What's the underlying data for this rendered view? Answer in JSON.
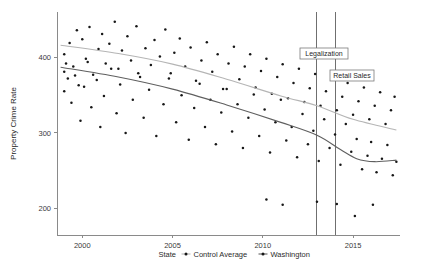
{
  "chart_data": {
    "type": "scatter",
    "title": "",
    "subtitle": "",
    "xlabel": "",
    "ylabel": "Property Crime Rate",
    "xlim": [
      1998.6,
      2017.6
    ],
    "ylim": [
      165,
      460
    ],
    "xticks": [
      2000,
      2005,
      2010,
      2015
    ],
    "xticklabels": [
      "2000",
      "2005",
      "2010",
      "2015"
    ],
    "yticks": [
      200,
      300,
      400
    ],
    "yticklabels": [
      "200",
      "300",
      "400"
    ],
    "grid": false,
    "legend_position": "bottom",
    "legend_title": "State",
    "annotations": [
      {
        "label": "Legalization",
        "x": 2013
      },
      {
        "label": "Retail Sales",
        "x": 2014
      }
    ],
    "vlines": [
      2013,
      2014
    ],
    "series": [
      {
        "name": "Control Average",
        "color": "#b5b5b5",
        "marker": "point",
        "trend": [
          {
            "x": 1998.8,
            "y": 416
          },
          {
            "x": 2002.0,
            "y": 405
          },
          {
            "x": 2005.0,
            "y": 391
          },
          {
            "x": 2008.0,
            "y": 371
          },
          {
            "x": 2011.0,
            "y": 349
          },
          {
            "x": 2013.0,
            "y": 336
          },
          {
            "x": 2015.0,
            "y": 318
          },
          {
            "x": 2017.4,
            "y": 304
          }
        ],
        "points": [
          {
            "x": 1999.0,
            "y": 404
          },
          {
            "x": 1999.0,
            "y": 381
          },
          {
            "x": 1999.2,
            "y": 372
          },
          {
            "x": 1999.3,
            "y": 419
          },
          {
            "x": 1999.5,
            "y": 388
          },
          {
            "x": 1999.7,
            "y": 436
          },
          {
            "x": 1999.8,
            "y": 363
          },
          {
            "x": 2000.0,
            "y": 424
          },
          {
            "x": 2000.2,
            "y": 398
          },
          {
            "x": 2000.4,
            "y": 440
          },
          {
            "x": 2000.6,
            "y": 377
          },
          {
            "x": 2000.9,
            "y": 411
          },
          {
            "x": 2001.1,
            "y": 431
          },
          {
            "x": 2001.3,
            "y": 392
          },
          {
            "x": 2001.5,
            "y": 418
          },
          {
            "x": 2001.8,
            "y": 447
          },
          {
            "x": 2002.0,
            "y": 385
          },
          {
            "x": 2002.2,
            "y": 409
          },
          {
            "x": 2002.5,
            "y": 428
          },
          {
            "x": 2002.7,
            "y": 396
          },
          {
            "x": 2003.0,
            "y": 441
          },
          {
            "x": 2003.2,
            "y": 374
          },
          {
            "x": 2003.5,
            "y": 412
          },
          {
            "x": 2003.8,
            "y": 390
          },
          {
            "x": 2004.0,
            "y": 423
          },
          {
            "x": 2004.3,
            "y": 401
          },
          {
            "x": 2004.6,
            "y": 437
          },
          {
            "x": 2004.9,
            "y": 379
          },
          {
            "x": 2005.1,
            "y": 406
          },
          {
            "x": 2005.4,
            "y": 425
          },
          {
            "x": 2005.7,
            "y": 388
          },
          {
            "x": 2006.0,
            "y": 413
          },
          {
            "x": 2006.3,
            "y": 369
          },
          {
            "x": 2006.6,
            "y": 396
          },
          {
            "x": 2006.9,
            "y": 420
          },
          {
            "x": 2007.2,
            "y": 381
          },
          {
            "x": 2007.5,
            "y": 404
          },
          {
            "x": 2007.8,
            "y": 358
          },
          {
            "x": 2008.1,
            "y": 392
          },
          {
            "x": 2008.4,
            "y": 414
          },
          {
            "x": 2008.7,
            "y": 371
          },
          {
            "x": 2009.0,
            "y": 388
          },
          {
            "x": 2009.3,
            "y": 404
          },
          {
            "x": 2009.6,
            "y": 360
          },
          {
            "x": 2009.9,
            "y": 382
          },
          {
            "x": 2010.2,
            "y": 398
          },
          {
            "x": 2010.5,
            "y": 352
          },
          {
            "x": 2010.8,
            "y": 374
          },
          {
            "x": 2011.1,
            "y": 391
          },
          {
            "x": 2011.4,
            "y": 346
          },
          {
            "x": 2011.7,
            "y": 366
          },
          {
            "x": 2012.0,
            "y": 385
          },
          {
            "x": 2012.3,
            "y": 341
          },
          {
            "x": 2012.6,
            "y": 359
          },
          {
            "x": 2012.9,
            "y": 378
          },
          {
            "x": 2013.2,
            "y": 336
          },
          {
            "x": 2013.5,
            "y": 355
          },
          {
            "x": 2013.8,
            "y": 372
          },
          {
            "x": 2014.1,
            "y": 330
          },
          {
            "x": 2014.4,
            "y": 348
          },
          {
            "x": 2014.7,
            "y": 366
          },
          {
            "x": 2015.0,
            "y": 324
          },
          {
            "x": 2015.3,
            "y": 342
          },
          {
            "x": 2015.6,
            "y": 360
          },
          {
            "x": 2015.9,
            "y": 318
          },
          {
            "x": 2016.2,
            "y": 336
          },
          {
            "x": 2016.5,
            "y": 354
          },
          {
            "x": 2016.8,
            "y": 312
          },
          {
            "x": 2017.1,
            "y": 330
          },
          {
            "x": 2017.3,
            "y": 348
          }
        ]
      },
      {
        "name": "Washington",
        "color": "#5f5f5f",
        "marker": "point",
        "trend": [
          {
            "x": 1998.8,
            "y": 387
          },
          {
            "x": 2002.0,
            "y": 374
          },
          {
            "x": 2005.0,
            "y": 358
          },
          {
            "x": 2008.0,
            "y": 337
          },
          {
            "x": 2011.0,
            "y": 314
          },
          {
            "x": 2013.0,
            "y": 297
          },
          {
            "x": 2014.3,
            "y": 278
          },
          {
            "x": 2015.2,
            "y": 266
          },
          {
            "x": 2016.2,
            "y": 262
          },
          {
            "x": 2017.4,
            "y": 264
          }
        ],
        "points": [
          {
            "x": 1999.0,
            "y": 355
          },
          {
            "x": 1999.1,
            "y": 392
          },
          {
            "x": 1999.4,
            "y": 340
          },
          {
            "x": 1999.6,
            "y": 376
          },
          {
            "x": 1999.9,
            "y": 316
          },
          {
            "x": 2000.1,
            "y": 361
          },
          {
            "x": 2000.3,
            "y": 394
          },
          {
            "x": 2000.5,
            "y": 334
          },
          {
            "x": 2000.8,
            "y": 370
          },
          {
            "x": 2001.0,
            "y": 308
          },
          {
            "x": 2001.2,
            "y": 349
          },
          {
            "x": 2001.6,
            "y": 385
          },
          {
            "x": 2001.9,
            "y": 326
          },
          {
            "x": 2002.1,
            "y": 364
          },
          {
            "x": 2002.4,
            "y": 300
          },
          {
            "x": 2002.8,
            "y": 344
          },
          {
            "x": 2003.1,
            "y": 379
          },
          {
            "x": 2003.4,
            "y": 320
          },
          {
            "x": 2003.7,
            "y": 357
          },
          {
            "x": 2004.1,
            "y": 296
          },
          {
            "x": 2004.5,
            "y": 338
          },
          {
            "x": 2004.8,
            "y": 372
          },
          {
            "x": 2005.2,
            "y": 314
          },
          {
            "x": 2005.5,
            "y": 350
          },
          {
            "x": 2005.9,
            "y": 291
          },
          {
            "x": 2006.2,
            "y": 333
          },
          {
            "x": 2006.5,
            "y": 365
          },
          {
            "x": 2006.8,
            "y": 308
          },
          {
            "x": 2007.1,
            "y": 344
          },
          {
            "x": 2007.4,
            "y": 285
          },
          {
            "x": 2007.7,
            "y": 327
          },
          {
            "x": 2008.0,
            "y": 358
          },
          {
            "x": 2008.3,
            "y": 302
          },
          {
            "x": 2008.6,
            "y": 338
          },
          {
            "x": 2008.9,
            "y": 280
          },
          {
            "x": 2009.2,
            "y": 320
          },
          {
            "x": 2009.5,
            "y": 351
          },
          {
            "x": 2009.8,
            "y": 296
          },
          {
            "x": 2010.1,
            "y": 331
          },
          {
            "x": 2010.2,
            "y": 212
          },
          {
            "x": 2010.4,
            "y": 274
          },
          {
            "x": 2010.7,
            "y": 314
          },
          {
            "x": 2011.0,
            "y": 344
          },
          {
            "x": 2011.1,
            "y": 205
          },
          {
            "x": 2011.3,
            "y": 290
          },
          {
            "x": 2011.6,
            "y": 308
          },
          {
            "x": 2011.9,
            "y": 268
          },
          {
            "x": 2012.2,
            "y": 325
          },
          {
            "x": 2012.5,
            "y": 285
          },
          {
            "x": 2012.8,
            "y": 303
          },
          {
            "x": 2013.0,
            "y": 209
          },
          {
            "x": 2013.1,
            "y": 263
          },
          {
            "x": 2013.4,
            "y": 318
          },
          {
            "x": 2013.7,
            "y": 280
          },
          {
            "x": 2014.0,
            "y": 298
          },
          {
            "x": 2014.1,
            "y": 206
          },
          {
            "x": 2014.3,
            "y": 258
          },
          {
            "x": 2014.6,
            "y": 312
          },
          {
            "x": 2014.9,
            "y": 275
          },
          {
            "x": 2015.1,
            "y": 190
          },
          {
            "x": 2015.2,
            "y": 292
          },
          {
            "x": 2015.5,
            "y": 252
          },
          {
            "x": 2015.8,
            "y": 270
          },
          {
            "x": 2016.0,
            "y": 288
          },
          {
            "x": 2016.1,
            "y": 205
          },
          {
            "x": 2016.3,
            "y": 248
          },
          {
            "x": 2016.6,
            "y": 266
          },
          {
            "x": 2016.9,
            "y": 284
          },
          {
            "x": 2017.2,
            "y": 244
          },
          {
            "x": 2017.4,
            "y": 262
          }
        ]
      }
    ]
  },
  "legend": {
    "title": "State",
    "entries": [
      {
        "label": "Control Average",
        "color": "#b5b5b5"
      },
      {
        "label": "Washington",
        "color": "#5f5f5f"
      }
    ]
  },
  "axes": {
    "y_title": "Property Crime Rate",
    "x_title": ""
  }
}
